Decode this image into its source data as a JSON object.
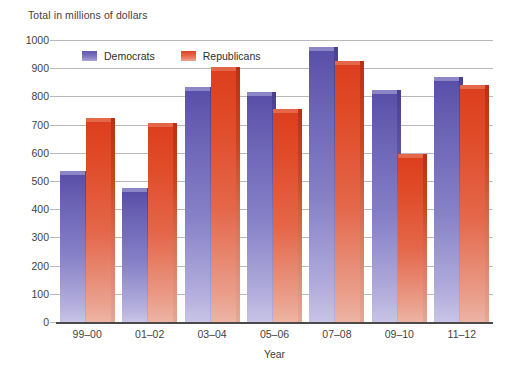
{
  "chart_data": {
    "type": "bar",
    "title": "",
    "ylabel": "Total in millions of dollars",
    "xlabel": "Year",
    "categories": [
      "99–00",
      "01–02",
      "03–04",
      "05–06",
      "07–08",
      "09–10",
      "11–12"
    ],
    "series": [
      {
        "name": "Democrats",
        "color": "#6059ae",
        "values": [
          520,
          460,
          820,
          800,
          960,
          810,
          855
        ]
      },
      {
        "name": "Republicans",
        "color": "#e04526",
        "values": [
          710,
          690,
          890,
          740,
          910,
          580,
          825
        ]
      }
    ],
    "ylim": [
      0,
      1000
    ],
    "ytick_step": 100,
    "yticks": [
      "1000",
      "900",
      "800",
      "700",
      "600",
      "500",
      "400",
      "300",
      "200",
      "100",
      "0"
    ],
    "grid": true,
    "legend_position": "top-left-inside"
  },
  "legend": {
    "items": [
      {
        "label": "Democrats"
      },
      {
        "label": "Republicans"
      }
    ]
  }
}
